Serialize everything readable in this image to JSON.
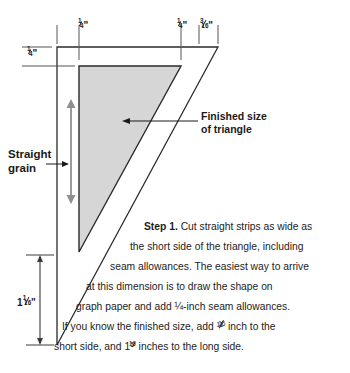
{
  "figure": {
    "type": "quilting-triangle-cutting-diagram",
    "title_text": "Step 1.",
    "colors": {
      "fill_gray": "#d4d4d4",
      "outline": "#1a1a1a",
      "grain_arrow": "#8c8c8c",
      "text": "#1a1a1a"
    }
  },
  "dimensions": {
    "top_left_seam": "¼\"",
    "top_mid_seam": "¼\"",
    "top_right_seam": "3⁄16\"",
    "left_top_seam": "¼\"",
    "short_side_total": "1 1⁄16\"",
    "top_left_seam_parts": {
      "whole": "",
      "num": "1",
      "den": "4",
      "unit": "\""
    },
    "top_mid_seam_parts": {
      "whole": "",
      "num": "1",
      "den": "4",
      "unit": "\""
    },
    "top_right_seam_parts": {
      "whole": "",
      "num": "3",
      "den": "16",
      "unit": "\""
    },
    "left_top_seam_parts": {
      "whole": "",
      "num": "1",
      "den": "4",
      "unit": "\""
    },
    "short_side_parts": {
      "whole": "1",
      "num": "1",
      "den": "16",
      "unit": "\""
    }
  },
  "callouts": {
    "straight_grain": "Straight\ngrain",
    "straight_grain_line1": "Straight",
    "straight_grain_line2": "grain",
    "finished_size_line1": "Finished size",
    "finished_size_line2": "of triangle"
  },
  "instructions": {
    "step_label": "Step 1.",
    "line1_rest": " Cut straight strips as wide as",
    "line2": "the short side of the triangle, including",
    "line3": "seam allowances. The easiest way to arrive",
    "line4": "at this dimension is to draw the shape on",
    "line5_a": "graph paper and add ",
    "line5_frac": "¼",
    "line5_b": "-inch seam allowances.",
    "line6_a": "If you know the finished size, add ",
    "line6_frac_num": "11",
    "line6_frac_den": "16",
    "line6_b": " inch to the",
    "line7_a": "short side, and 1",
    "line7_frac_num": "5",
    "line7_frac_den": "16",
    "line7_b": " inches to the long side.",
    "full_text": "Step 1. Cut straight strips as wide as the short side of the triangle, including seam allowances. The easiest way to arrive at this dimension is to draw the shape on graph paper and add ¼-inch seam allowances. If you know the finished size, add 11⁄16 inch to the short side, and 1 5⁄16 inches to the long side."
  }
}
